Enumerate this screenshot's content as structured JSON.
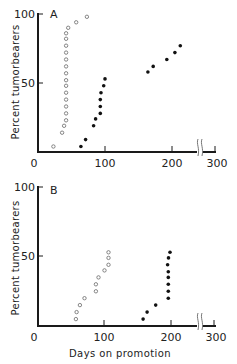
{
  "chart_data": [
    {
      "type": "scatter",
      "panel_label": "A",
      "title": "",
      "xlabel": "",
      "ylabel": "Percent tumorbearers",
      "xlim": [
        0,
        300
      ],
      "ylim": [
        0,
        100
      ],
      "x_ticks": [
        "0",
        "100",
        "200",
        "300"
      ],
      "y_ticks": [
        "50",
        "100"
      ],
      "axis_break": "between 200 and 300 on x-axis",
      "grid": false,
      "series": [
        {
          "name": "open circles",
          "marker": "open-circle",
          "points": [
            [
              23,
              4
            ],
            [
              36,
              14
            ],
            [
              39,
              19
            ],
            [
              42,
              23
            ],
            [
              42,
              28
            ],
            [
              42,
              33
            ],
            [
              42,
              38
            ],
            [
              42,
              43
            ],
            [
              42,
              48
            ],
            [
              42,
              52
            ],
            [
              42,
              57
            ],
            [
              42,
              62
            ],
            [
              42,
              67
            ],
            [
              42,
              72
            ],
            [
              42,
              77
            ],
            [
              42,
              82
            ],
            [
              42,
              86
            ],
            [
              45,
              90
            ],
            [
              57,
              94
            ],
            [
              73,
              98
            ]
          ]
        },
        {
          "name": "filled circles",
          "marker": "filled-circle",
          "points": [
            [
              64,
              4
            ],
            [
              71,
              9
            ],
            [
              83,
              19
            ],
            [
              86,
              24
            ],
            [
              93,
              28
            ],
            [
              93,
              33
            ],
            [
              93,
              38
            ],
            [
              94,
              43
            ],
            [
              98,
              48
            ],
            [
              100,
              53
            ],
            [
              164,
              58
            ],
            [
              172,
              62
            ],
            [
              212,
              67
            ],
            [
              221,
              72
            ],
            [
              227,
              77
            ]
          ]
        }
      ]
    },
    {
      "type": "scatter",
      "panel_label": "B",
      "title": "",
      "xlabel": "Days on promotion",
      "ylabel": "Percent tumorbearers",
      "xlim": [
        0,
        300
      ],
      "ylim": [
        0,
        100
      ],
      "x_ticks": [
        "0",
        "100",
        "200",
        "300"
      ],
      "y_ticks": [
        "50",
        "100"
      ],
      "axis_break": "between 200 and 300 on x-axis",
      "grid": false,
      "series": [
        {
          "name": "open circles",
          "marker": "open-circle",
          "points": [
            [
              57,
              5
            ],
            [
              58,
              10
            ],
            [
              63,
              15
            ],
            [
              70,
              20
            ],
            [
              87,
              25
            ],
            [
              87,
              30
            ],
            [
              91,
              35
            ],
            [
              100,
              40
            ],
            [
              106,
              44
            ],
            [
              106,
              49
            ],
            [
              106,
              53
            ]
          ]
        },
        {
          "name": "filled circles",
          "marker": "filled-circle",
          "points": [
            [
              158,
              5
            ],
            [
              164,
              10
            ],
            [
              177,
              15
            ],
            [
              196,
              20
            ],
            [
              196,
              25
            ],
            [
              196,
              30
            ],
            [
              196,
              35
            ],
            [
              196,
              39
            ],
            [
              203,
              44
            ],
            [
              205,
              49
            ],
            [
              208,
              53
            ]
          ]
        }
      ]
    }
  ],
  "labels": {
    "panel_a": "A",
    "panel_b": "B",
    "ylabel": "Percent tumorbearers",
    "xlabel": "Days on promotion",
    "x_tick_0": "0",
    "x_tick_100": "100",
    "x_tick_200": "200",
    "x_tick_300": "300",
    "y_tick_50": "50",
    "y_tick_100": "100"
  }
}
